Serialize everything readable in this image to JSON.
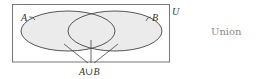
{
  "diagram": {
    "type": "venn",
    "universe_label": "U",
    "set_a_label": "A",
    "set_b_label": "B",
    "union_label": "A∪B",
    "caption": "Union",
    "colors": {
      "fill": "#ebebeb",
      "stroke": "#444444",
      "border": "#777777",
      "caption": "#8a8a8a"
    }
  }
}
